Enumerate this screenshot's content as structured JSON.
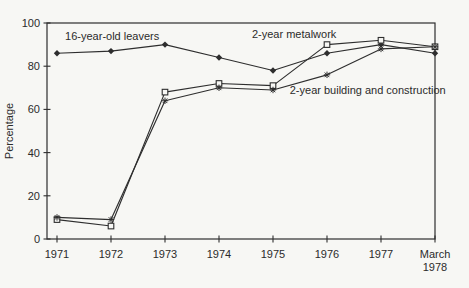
{
  "chart_data": {
    "type": "line",
    "title": "",
    "xlabel": "",
    "ylabel": "Percentage",
    "ylim": [
      0,
      100
    ],
    "yticks": [
      0,
      20,
      40,
      60,
      80,
      100
    ],
    "grid": false,
    "frame": true,
    "legend_position": "inline-annotations",
    "categories": [
      "1971",
      "1972",
      "1973",
      "1974",
      "1975",
      "1976",
      "1977",
      "March\n1978"
    ],
    "series": [
      {
        "name": "16-year-old leavers",
        "marker": "diamond-filled",
        "values": [
          86,
          87,
          90,
          84,
          78,
          86,
          90,
          86
        ]
      },
      {
        "name": "2-year metalwork",
        "marker": "square-open",
        "values": [
          9,
          6,
          68,
          72,
          71,
          90,
          92,
          89
        ]
      },
      {
        "name": "2-year building and construction",
        "marker": "asterisk",
        "values": [
          10,
          9,
          64,
          70,
          69,
          76,
          88,
          89
        ]
      }
    ],
    "annotations": [
      {
        "text": "16-year-old leavers",
        "x": 0.15,
        "y": 93.5,
        "anchor": "start"
      },
      {
        "text": "2-year metalwork",
        "x": 3.61,
        "y": 94.5,
        "anchor": "start"
      },
      {
        "text": "2-year building and construction",
        "x": 4.31,
        "y": 68.5,
        "anchor": "start"
      }
    ],
    "colors": {
      "ink": "#2e2e2e",
      "background": "#f7f7f4"
    }
  }
}
